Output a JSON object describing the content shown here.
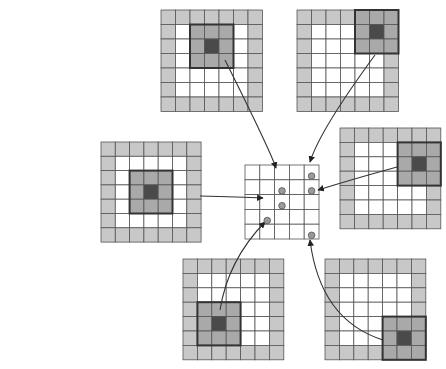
{
  "diagram": {
    "title": "",
    "colors": {
      "background": "#ffffff",
      "border_cell": "#c8c8c8",
      "interior_cell": "#ffffff",
      "kernel_cell": "#a9a9a9",
      "kernel_center": "#4a4a4a",
      "grid_line": "#555555",
      "kernel_border": "#333333",
      "output_cell": "#ffffff",
      "dot_fill": "#9a9a9a",
      "dot_stroke": "#555555",
      "arrow": "#333333"
    },
    "input_grids": [
      {
        "id": "grid-top-left",
        "x": 161,
        "y": 10,
        "size": 7,
        "cell": 14.5,
        "kernel_center": [
          2,
          3
        ],
        "target": [
          1,
          2
        ],
        "curve": [
          [
            225,
            60
          ],
          [
            270,
            150
          ],
          [
            276,
            168
          ]
        ]
      },
      {
        "id": "grid-top-right",
        "x": 297,
        "y": 10,
        "size": 7,
        "cell": 14.5,
        "kernel_center": [
          1,
          5
        ],
        "target": [
          0,
          4
        ],
        "curve": [
          [
            375,
            55
          ],
          [
            320,
            130
          ],
          [
            310,
            162
          ]
        ]
      },
      {
        "id": "grid-left",
        "x": 101,
        "y": 142,
        "size": 7,
        "cell": 14.3,
        "kernel_center": [
          3,
          3
        ],
        "target": [
          2,
          2
        ],
        "curve": [
          [
            200,
            196
          ],
          [
            240,
            197
          ],
          [
            263,
            198
          ]
        ]
      },
      {
        "id": "grid-right",
        "x": 340,
        "y": 128,
        "size": 7,
        "cell": 14.4,
        "kernel_center": [
          2,
          5
        ],
        "target": [
          1,
          4
        ],
        "curve": [
          [
            397,
            167
          ],
          [
            350,
            180
          ],
          [
            318,
            190
          ]
        ]
      },
      {
        "id": "grid-bottom",
        "x": 183,
        "y": 259,
        "size": 7,
        "cell": 14.4,
        "kernel_center": [
          4,
          2
        ],
        "target": [
          3,
          1
        ],
        "curve": [
          [
            220,
            310
          ],
          [
            228,
            260
          ],
          [
            265,
            222
          ]
        ]
      },
      {
        "id": "grid-bottom-right",
        "x": 325,
        "y": 259,
        "size": 7,
        "cell": 14.4,
        "kernel_center": [
          5,
          5
        ],
        "target": [
          4,
          4
        ],
        "curve": [
          [
            383,
            340
          ],
          [
            320,
            320
          ],
          [
            310,
            240
          ]
        ]
      }
    ],
    "output_grid": {
      "id": "output-grid",
      "x": 245,
      "y": 165,
      "size": 5,
      "cell": 14.8,
      "dots": [
        [
          0,
          4
        ],
        [
          1,
          2
        ],
        [
          1,
          4
        ],
        [
          2,
          2
        ],
        [
          3,
          1
        ],
        [
          4,
          4
        ]
      ]
    }
  }
}
